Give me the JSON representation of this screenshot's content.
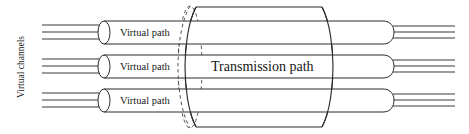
{
  "figure": {
    "type": "diagram",
    "background_color": "#ffffff",
    "line_color": "#2b2b2b",
    "width": 469,
    "height": 134
  },
  "labels": {
    "virtual_channels": "Virtual channels",
    "transmission_path": "Transmission path",
    "virtual_path_1": "Virtual path",
    "virtual_path_2": "Virtual path",
    "virtual_path_3": "Virtual path"
  },
  "structure": {
    "virtual_path_count": 3,
    "virtual_channels_per_path_left": 3,
    "virtual_channels_per_path_right": 3,
    "outer_cylinder": {
      "name": "transmission-path-cylinder",
      "left_edge_style": "dashed-ellipse-hidden",
      "right_edge_style": "solid-arc",
      "x_start": 188,
      "x_end": 330,
      "y_top": 6,
      "y_bottom": 128
    },
    "virtual_paths": [
      {
        "index": 1,
        "label": "Virtual path",
        "y_top": 21,
        "y_bottom": 45,
        "x_start": 98,
        "x_end": 392,
        "left_cap": "open-ellipse",
        "right_cap": "rounded-half-ellipse"
      },
      {
        "index": 2,
        "label": "Virtual path",
        "y_top": 55,
        "y_bottom": 79,
        "x_start": 98,
        "x_end": 392,
        "left_cap": "open-ellipse",
        "right_cap": "rounded-half-ellipse"
      },
      {
        "index": 3,
        "label": "Virtual path",
        "y_top": 89,
        "y_bottom": 113,
        "x_start": 98,
        "x_end": 392,
        "left_cap": "open-ellipse",
        "right_cap": "rounded-half-ellipse"
      }
    ]
  }
}
